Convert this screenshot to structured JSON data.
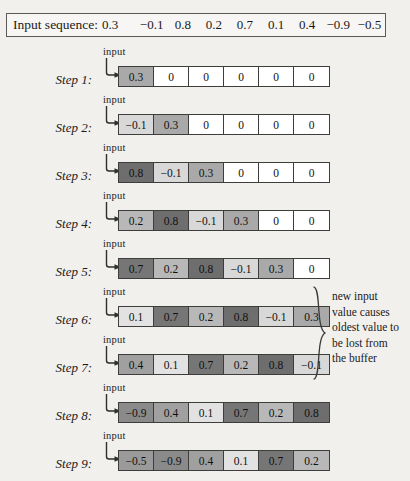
{
  "header": {
    "label": "Input sequence:",
    "values": [
      "0.3",
      "−0.1",
      "0.8",
      "0.2",
      "0.7",
      "0.1",
      "0.4",
      "−0.9",
      "−0.5"
    ]
  },
  "input_caption": "input",
  "shades": {
    "empty": "#ffffff",
    "0.3": "#a9a9a9",
    "-0.1": "#d8d8d8",
    "0.8": "#6e6e6e",
    "0.2": "#b8b8b8",
    "0.7": "#767676",
    "0.1": "#e2e2e2",
    "0.4": "#a0a0a0",
    "-0.9": "#8a8a8a",
    "-0.5": "#9a9a9a"
  },
  "steps": [
    {
      "label": "Step 1:",
      "top": 46,
      "cells": [
        {
          "value": "0.3",
          "shade": "#a9a9a9"
        },
        {
          "value": "0",
          "shade": "#ffffff"
        },
        {
          "value": "0",
          "shade": "#ffffff"
        },
        {
          "value": "0",
          "shade": "#ffffff"
        },
        {
          "value": "0",
          "shade": "#ffffff"
        },
        {
          "value": "0",
          "shade": "#ffffff"
        }
      ]
    },
    {
      "label": "Step 2:",
      "top": 94,
      "cells": [
        {
          "value": "−0.1",
          "shade": "#d8d8d8"
        },
        {
          "value": "0.3",
          "shade": "#a9a9a9"
        },
        {
          "value": "0",
          "shade": "#ffffff"
        },
        {
          "value": "0",
          "shade": "#ffffff"
        },
        {
          "value": "0",
          "shade": "#ffffff"
        },
        {
          "value": "0",
          "shade": "#ffffff"
        }
      ]
    },
    {
      "label": "Step 3:",
      "top": 142,
      "cells": [
        {
          "value": "0.8",
          "shade": "#6e6e6e"
        },
        {
          "value": "−0.1",
          "shade": "#d8d8d8"
        },
        {
          "value": "0.3",
          "shade": "#a9a9a9"
        },
        {
          "value": "0",
          "shade": "#ffffff"
        },
        {
          "value": "0",
          "shade": "#ffffff"
        },
        {
          "value": "0",
          "shade": "#ffffff"
        }
      ]
    },
    {
      "label": "Step 4:",
      "top": 190,
      "cells": [
        {
          "value": "0.2",
          "shade": "#b8b8b8"
        },
        {
          "value": "0.8",
          "shade": "#6e6e6e"
        },
        {
          "value": "−0.1",
          "shade": "#d8d8d8"
        },
        {
          "value": "0.3",
          "shade": "#a9a9a9"
        },
        {
          "value": "0",
          "shade": "#ffffff"
        },
        {
          "value": "0",
          "shade": "#ffffff"
        }
      ]
    },
    {
      "label": "Step 5:",
      "top": 238,
      "cells": [
        {
          "value": "0.7",
          "shade": "#767676"
        },
        {
          "value": "0.2",
          "shade": "#b8b8b8"
        },
        {
          "value": "0.8",
          "shade": "#6e6e6e"
        },
        {
          "value": "−0.1",
          "shade": "#d8d8d8"
        },
        {
          "value": "0.3",
          "shade": "#a9a9a9"
        },
        {
          "value": "0",
          "shade": "#ffffff"
        }
      ]
    },
    {
      "label": "Step 6:",
      "top": 286,
      "cells": [
        {
          "value": "0.1",
          "shade": "#e2e2e2"
        },
        {
          "value": "0.7",
          "shade": "#767676"
        },
        {
          "value": "0.2",
          "shade": "#b8b8b8"
        },
        {
          "value": "0.8",
          "shade": "#6e6e6e"
        },
        {
          "value": "−0.1",
          "shade": "#d8d8d8"
        },
        {
          "value": "0.3",
          "shade": "#a9a9a9"
        }
      ]
    },
    {
      "label": "Step 7:",
      "top": 334,
      "cells": [
        {
          "value": "0.4",
          "shade": "#a0a0a0"
        },
        {
          "value": "0.1",
          "shade": "#e2e2e2"
        },
        {
          "value": "0.7",
          "shade": "#767676"
        },
        {
          "value": "0.2",
          "shade": "#b8b8b8"
        },
        {
          "value": "0.8",
          "shade": "#6e6e6e"
        },
        {
          "value": "−0.1",
          "shade": "#d8d8d8"
        }
      ]
    },
    {
      "label": "Step 8:",
      "top": 382,
      "cells": [
        {
          "value": "−0.9",
          "shade": "#8a8a8a"
        },
        {
          "value": "0.4",
          "shade": "#a0a0a0"
        },
        {
          "value": "0.1",
          "shade": "#e2e2e2"
        },
        {
          "value": "0.7",
          "shade": "#767676"
        },
        {
          "value": "0.2",
          "shade": "#b8b8b8"
        },
        {
          "value": "0.8",
          "shade": "#6e6e6e"
        }
      ]
    },
    {
      "label": "Step 9:",
      "top": 430,
      "cells": [
        {
          "value": "−0.5",
          "shade": "#9a9a9a"
        },
        {
          "value": "−0.9",
          "shade": "#8a8a8a"
        },
        {
          "value": "0.4",
          "shade": "#a0a0a0"
        },
        {
          "value": "0.1",
          "shade": "#e2e2e2"
        },
        {
          "value": "0.7",
          "shade": "#767676"
        },
        {
          "value": "0.2",
          "shade": "#b8b8b8"
        }
      ]
    }
  ],
  "annotation": {
    "lines": [
      "new input",
      "value causes",
      "oldest value to",
      "be lost from",
      "the buffer"
    ]
  }
}
